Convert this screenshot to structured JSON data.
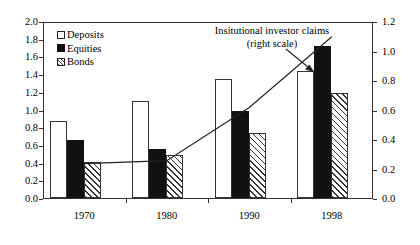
{
  "chart_data": {
    "type": "bar",
    "title": "",
    "xlabel": "",
    "ylabel": "",
    "categories": [
      "1970",
      "1980",
      "1990",
      "1998"
    ],
    "series": [
      {
        "name": "Deposits",
        "values": [
          0.87,
          1.1,
          1.35,
          1.43
        ],
        "style": "white-outline"
      },
      {
        "name": "Equities",
        "values": [
          0.65,
          0.55,
          0.98,
          1.72
        ],
        "style": "black-filled"
      },
      {
        "name": "Bonds",
        "values": [
          0.41,
          0.49,
          0.73,
          1.19
        ],
        "style": "diagonal-hatch"
      }
    ],
    "line_series": {
      "name": "Insitutional investor claims (right scale)",
      "axis": "right",
      "values": [
        0.24,
        0.26,
        0.62,
        1.1
      ]
    },
    "ylim": [
      0.0,
      2.0
    ],
    "yticks": [
      "0.0",
      "0.2",
      "0.4",
      "0.6",
      "0.8",
      "1.0",
      "1.2",
      "1.4",
      "1.6",
      "1.8",
      "2.0"
    ],
    "ylim_right": [
      0.0,
      1.2
    ],
    "yticks_right": [
      "0.0",
      "0.2",
      "0.4",
      "0.6",
      "0.8",
      "1.0",
      "1.2"
    ],
    "grid": false,
    "legend_position": "top-left",
    "annotations": [
      {
        "text_line1": "Insitutional investor claims",
        "text_line2": "(right scale)",
        "has_arrow": true
      }
    ]
  },
  "legend": {
    "items": [
      {
        "label": "Deposits"
      },
      {
        "label": "Equities"
      },
      {
        "label": "Bonds"
      }
    ]
  },
  "annotation": {
    "line1": "Insitutional investor claims",
    "line2": "(right scale)"
  },
  "colors": {
    "axis": "#333333",
    "equities_fill": "#111111",
    "background": "#ffffff"
  }
}
